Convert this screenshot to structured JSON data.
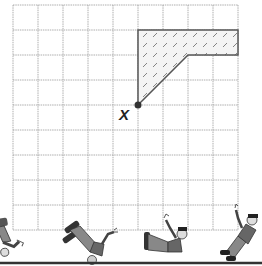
{
  "diagram": {
    "grid": {
      "origin_x": 13,
      "origin_y": 5,
      "cell": 25,
      "cols": 9,
      "rows": 9,
      "line_color": "#9a9a9a"
    },
    "shape": {
      "name": "hatched-polygon",
      "points_grid": [
        [
          5,
          1
        ],
        [
          9,
          1
        ],
        [
          9,
          2
        ],
        [
          7,
          2
        ],
        [
          5,
          4
        ]
      ],
      "fill_pattern": "diagonal-hatch",
      "stroke_color": "#555555"
    },
    "point": {
      "label": "X",
      "grid": [
        5,
        4
      ],
      "color": "#333333"
    },
    "figures": [
      {
        "name": "tumbling-person-1",
        "pose": "falling-headfirst-left-edge"
      },
      {
        "name": "tumbling-person-2",
        "pose": "upside-down"
      },
      {
        "name": "tumbling-person-3",
        "pose": "lying-sideways"
      },
      {
        "name": "tumbling-person-4",
        "pose": "sitting-up"
      }
    ],
    "ground_line_color": "#333333"
  }
}
